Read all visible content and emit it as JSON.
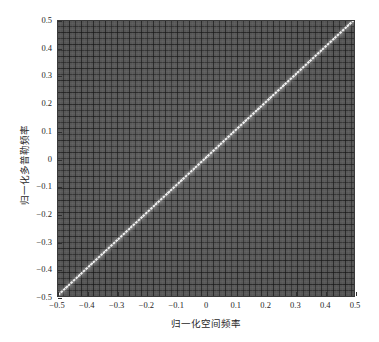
{
  "figure": {
    "background_color": "#ffffff",
    "plot_background_color": "#585858",
    "ridge_color": "#efefef",
    "axis_color": "#2e2e2e"
  },
  "chart_data": {
    "type": "heatmap",
    "title": "",
    "subtitle": "",
    "xlabel": "归一化空间频率",
    "ylabel": "归一化多普勒频率",
    "xlim": [
      -0.5,
      0.5
    ],
    "ylim": [
      -0.5,
      0.5
    ],
    "grid": false,
    "legend": "none",
    "colorbar": false,
    "xticks": [
      -0.5,
      -0.4,
      -0.3,
      -0.2,
      -0.1,
      0,
      0.1,
      0.2,
      0.3,
      0.4,
      0.5
    ],
    "yticks": [
      -0.5,
      -0.4,
      -0.3,
      -0.2,
      -0.1,
      0,
      0.1,
      0.2,
      0.3,
      0.4,
      0.5
    ],
    "xtick_labels": [
      "−0.5",
      "−0.4",
      "−0.3",
      "−0.2",
      "−0.1",
      "0",
      "0.1",
      "0.2",
      "0.3",
      "0.4",
      "0.5"
    ],
    "ytick_labels": [
      "−0.5",
      "−0.4",
      "−0.3",
      "−0.2",
      "−0.1",
      "0",
      "0.1",
      "0.2",
      "0.3",
      "0.4",
      "0.5"
    ],
    "annotations": [
      {
        "name": "clutter-ridge",
        "kind": "line",
        "slope": 1.0,
        "intercept": 0.0,
        "x": [
          -0.5,
          0.5
        ],
        "y": [
          -0.5,
          0.5
        ],
        "color": "#efefef"
      }
    ],
    "series": [
      {
        "name": "clutter-power",
        "kind": "image",
        "x_range": [
          -0.5,
          0.5
        ],
        "y_range": [
          -0.5,
          0.5
        ],
        "background_level_db": -40,
        "ridge_level_db": 0,
        "colormap": "gray"
      }
    ]
  }
}
